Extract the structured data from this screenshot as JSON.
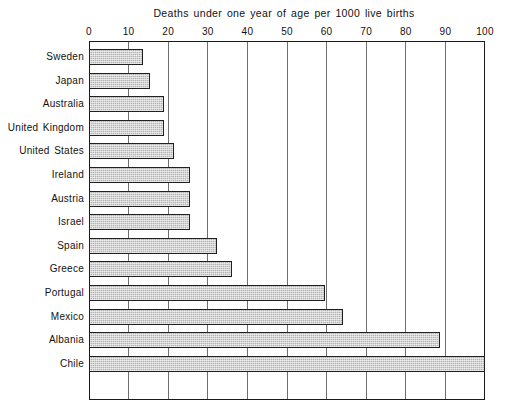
{
  "chart_data": {
    "type": "bar",
    "orientation": "horizontal",
    "title": "Deaths under one year of age per 1000 live births",
    "xlabel": "",
    "ylabel": "",
    "xlim": [
      0,
      100
    ],
    "xticks": [
      0,
      10,
      20,
      30,
      40,
      50,
      60,
      70,
      80,
      90,
      100
    ],
    "xtick_labels": [
      "0",
      "10",
      "20",
      "30",
      "40",
      "50",
      "60",
      "70",
      "80",
      "90",
      "100"
    ],
    "grid": true,
    "grid_axis": "x",
    "legend": false,
    "categories": [
      "Sweden",
      "Japan",
      "Australia",
      "United Kingdom",
      "United States",
      "Ireland",
      "Austria",
      "Israel",
      "Spain",
      "Greece",
      "Portugal",
      "Mexico",
      "Albania",
      "Chile"
    ],
    "values": [
      13.6,
      15.5,
      19.0,
      19.0,
      21.5,
      25.5,
      25.5,
      25.5,
      32.3,
      36.1,
      59.6,
      64.1,
      88.6,
      100.0
    ],
    "bar_face_color": "#b3b3b3",
    "bar_edge_color": "#202020",
    "axis_color": "#1a1a1a",
    "grid_color": "#6f6f6f",
    "background": "#ffffff"
  }
}
